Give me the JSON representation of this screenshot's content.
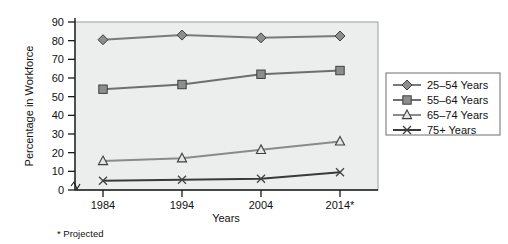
{
  "chart_data": {
    "type": "line",
    "title": "",
    "xlabel": "Years",
    "ylabel": "Percentage in Workforce",
    "categories": [
      "1984",
      "1994",
      "2004",
      "2014*"
    ],
    "x_tick_labels": [
      "1984",
      "1994",
      "2004",
      "2014*"
    ],
    "y_tick_labels": [
      "0",
      "10",
      "20",
      "30",
      "40",
      "50",
      "60",
      "70",
      "80",
      "90"
    ],
    "y_ticks": [
      0,
      10,
      20,
      30,
      40,
      50,
      60,
      70,
      80,
      90
    ],
    "ylim": [
      0,
      90
    ],
    "grid": false,
    "legend_position": "right",
    "axis_break": true,
    "footnote": "* Projected",
    "series": [
      {
        "name": "25–54 Years",
        "marker": "diamond",
        "color": "#7a7a7a",
        "values": [
          80.5,
          83.0,
          81.5,
          82.5
        ]
      },
      {
        "name": "55–64 Years",
        "marker": "square",
        "color": "#6e6e6e",
        "values": [
          54.0,
          56.5,
          62.0,
          64.0
        ]
      },
      {
        "name": "65–74 Years",
        "marker": "triangle",
        "color": "#8a8a8a",
        "values": [
          15.5,
          17.0,
          21.5,
          26.0
        ]
      },
      {
        "name": "75+ Years",
        "marker": "x",
        "color": "#3a3a3a",
        "values": [
          5.0,
          5.5,
          6.0,
          9.5
        ]
      }
    ]
  },
  "axes": {
    "y_axis_title": "Percentage in Workforce",
    "x_axis_title": "Years",
    "y_tick_0": "0",
    "y_tick_1": "10",
    "y_tick_2": "20",
    "y_tick_3": "30",
    "y_tick_4": "40",
    "y_tick_5": "50",
    "y_tick_6": "60",
    "y_tick_7": "70",
    "y_tick_8": "80",
    "y_tick_9": "90",
    "x_tick_0": "1984",
    "x_tick_1": "1994",
    "x_tick_2": "2004",
    "x_tick_3": "2014*"
  },
  "legend": {
    "entries": [
      {
        "label": "25–54 Years"
      },
      {
        "label": "55–64 Years"
      },
      {
        "label": "65–74 Years"
      },
      {
        "label": "75+ Years"
      }
    ]
  },
  "footnote": {
    "text": "* Projected"
  },
  "colors": {
    "plot_background": "#eceeee",
    "plot_border": "#9aa0a0",
    "axis": "#1a1a1a",
    "series_1": "#7a7a7a",
    "series_2": "#6e6e6e",
    "series_3": "#8a8a8a",
    "series_4": "#3a3a3a",
    "marker_fill": "#8d8d8d",
    "marker_stroke": "#3f3f3f",
    "legend_border": "#6d6d6d",
    "page_background": "#ffffff"
  }
}
